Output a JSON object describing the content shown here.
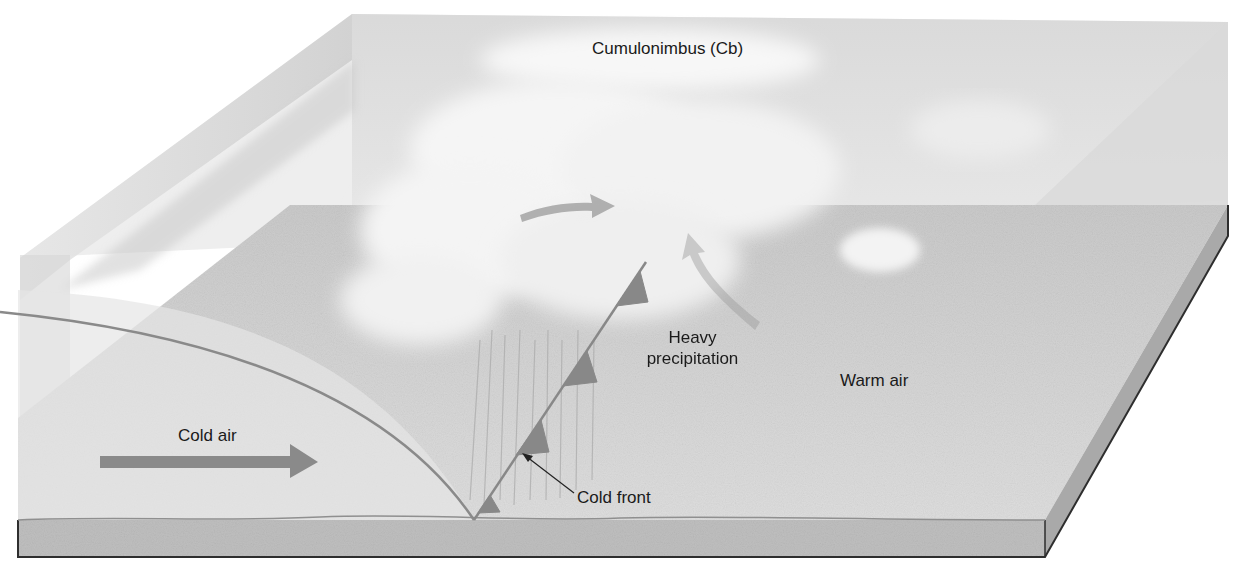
{
  "labels": {
    "cloud": "Cumulonimbus (Cb)",
    "precip_line1": "Heavy",
    "precip_line2": "precipitation",
    "warm_air": "Warm air",
    "cold_air": "Cold air",
    "cold_front": "Cold front"
  },
  "colors": {
    "background": "#ffffff",
    "ground_top": "#d4d4d4",
    "ground_side": "#bdbdbd",
    "air_volume": "#dcdcdc",
    "cloud": "#f4f4f4",
    "front_line": "#8a8a8a",
    "arrow": "#8c8c8c",
    "outline": "#3a3a3a",
    "text": "#1a1a1a"
  },
  "icons": {
    "cold_front_triangles": "triangle-pip",
    "cold_air_arrow": "arrow-right",
    "warm_air_arrow": "arrow-right",
    "leader_arrow": "arrow-pointer"
  }
}
